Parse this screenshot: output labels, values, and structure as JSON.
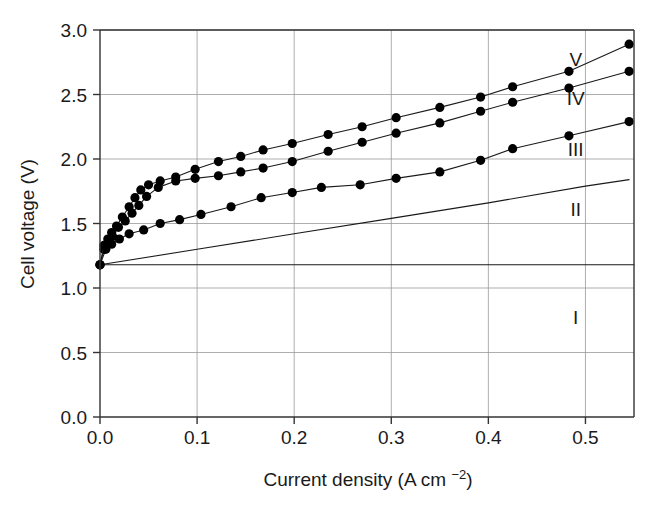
{
  "chart_data": {
    "type": "line",
    "title": "",
    "xlabel": "Current density (A cm−2)",
    "ylabel": "Cell voltage (V)",
    "xlim": [
      0.0,
      0.55
    ],
    "ylim": [
      0.0,
      3.0
    ],
    "xticks": [
      "0.0",
      "0.1",
      "0.2",
      "0.3",
      "0.4",
      "0.5"
    ],
    "xtick_values": [
      0.0,
      0.1,
      0.2,
      0.3,
      0.4,
      0.5
    ],
    "yticks": [
      "0.0",
      "0.5",
      "1.0",
      "1.5",
      "2.0",
      "2.5",
      "3.0"
    ],
    "ytick_values": [
      0.0,
      0.5,
      1.0,
      1.5,
      2.0,
      2.5,
      3.0
    ],
    "grid": true,
    "grid_color": "#999999",
    "legend_position": "inline-right",
    "line_color": "#1a1a1a",
    "marker_color": "#000000",
    "marker": "circle",
    "series": [
      {
        "name": "I",
        "label": "I",
        "markers": false,
        "label_x": 0.49,
        "label_y": 0.72,
        "x": [
          0.0,
          0.1,
          0.2,
          0.3,
          0.4,
          0.5,
          0.55
        ],
        "y": [
          1.18,
          1.18,
          1.18,
          1.18,
          1.18,
          1.18,
          1.18
        ]
      },
      {
        "name": "II",
        "label": "II",
        "markers": false,
        "label_x": 0.49,
        "label_y": 1.56,
        "x": [
          0.0,
          0.1,
          0.2,
          0.3,
          0.4,
          0.5,
          0.545
        ],
        "y": [
          1.18,
          1.3,
          1.42,
          1.54,
          1.66,
          1.79,
          1.84
        ]
      },
      {
        "name": "III",
        "label": "III",
        "markers": true,
        "label_x": 0.49,
        "label_y": 2.02,
        "x": [
          0.0,
          0.006,
          0.012,
          0.02,
          0.03,
          0.045,
          0.062,
          0.082,
          0.104,
          0.135,
          0.166,
          0.198,
          0.228,
          0.268,
          0.305,
          0.35,
          0.392,
          0.425,
          0.483,
          0.545
        ],
        "y": [
          1.18,
          1.3,
          1.34,
          1.38,
          1.42,
          1.45,
          1.5,
          1.53,
          1.57,
          1.63,
          1.7,
          1.74,
          1.78,
          1.8,
          1.85,
          1.9,
          1.99,
          2.08,
          2.18,
          2.29
        ]
      },
      {
        "name": "IV",
        "label": "IV",
        "markers": true,
        "label_x": 0.49,
        "label_y": 2.42,
        "x": [
          0.0,
          0.004,
          0.008,
          0.013,
          0.019,
          0.026,
          0.033,
          0.04,
          0.048,
          0.06,
          0.078,
          0.098,
          0.122,
          0.145,
          0.168,
          0.198,
          0.235,
          0.27,
          0.305,
          0.35,
          0.392,
          0.425,
          0.483,
          0.545
        ],
        "y": [
          1.18,
          1.3,
          1.34,
          1.4,
          1.47,
          1.52,
          1.58,
          1.64,
          1.71,
          1.78,
          1.83,
          1.85,
          1.87,
          1.9,
          1.93,
          1.98,
          2.06,
          2.13,
          2.2,
          2.28,
          2.37,
          2.44,
          2.55,
          2.68
        ]
      },
      {
        "name": "V",
        "label": "V",
        "markers": true,
        "label_x": 0.49,
        "label_y": 2.72,
        "x": [
          0.0,
          0.004,
          0.008,
          0.012,
          0.017,
          0.023,
          0.03,
          0.036,
          0.042,
          0.05,
          0.062,
          0.078,
          0.098,
          0.122,
          0.145,
          0.168,
          0.198,
          0.235,
          0.27,
          0.305,
          0.35,
          0.392,
          0.425,
          0.483,
          0.545
        ],
        "y": [
          1.18,
          1.33,
          1.38,
          1.43,
          1.48,
          1.55,
          1.63,
          1.7,
          1.76,
          1.8,
          1.83,
          1.86,
          1.92,
          1.98,
          2.02,
          2.07,
          2.12,
          2.19,
          2.25,
          2.32,
          2.4,
          2.48,
          2.56,
          2.68,
          2.89
        ]
      }
    ],
    "axis_units": {
      "x_unit_base": "A cm",
      "x_unit_exponent": "−2"
    }
  }
}
